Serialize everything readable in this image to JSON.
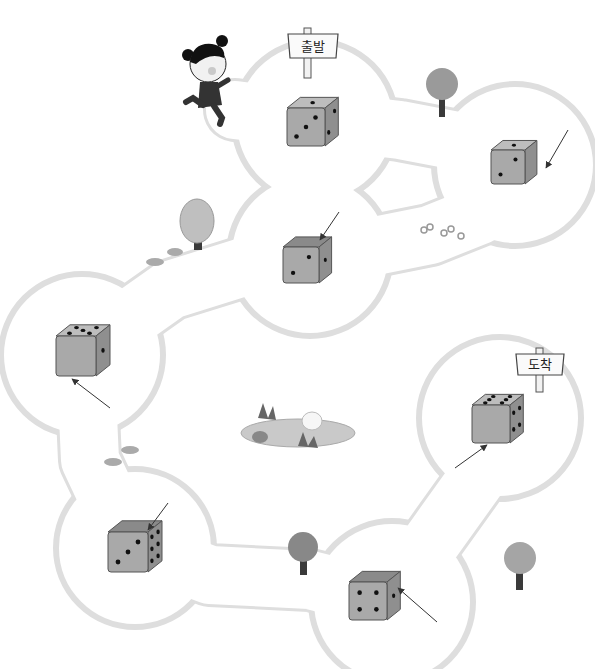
{
  "worksheet": {
    "start_sign": "출발",
    "finish_sign": "도착",
    "colors": {
      "path_outline": "#dedede",
      "die_top": "#bdbdbd",
      "die_front": "#a9a9a9",
      "die_side": "#8f8f8f",
      "die_top_dark": "#8a8a8a",
      "pip": "#111111",
      "tree_canopy": "#9a9a9a",
      "tree_trunk": "#3a3a3a",
      "arrow": "#333333"
    },
    "dice": [
      {
        "id": "die-1",
        "top": 1,
        "front": 3,
        "side": 2,
        "arrow": false
      },
      {
        "id": "die-2",
        "top": 1,
        "front": 2,
        "side": 0,
        "arrow_target": "side"
      },
      {
        "id": "die-3",
        "top": 0,
        "front": 2,
        "side": 1,
        "arrow_target": "top"
      },
      {
        "id": "die-4",
        "top": 5,
        "front": 0,
        "side": 1,
        "arrow_target": "front-bottom"
      },
      {
        "id": "die-5",
        "top": 0,
        "front": 3,
        "side": 6,
        "arrow_target": "top"
      },
      {
        "id": "die-6",
        "top": 0,
        "front": 4,
        "side": 1,
        "arrow_target": "side"
      },
      {
        "id": "die-7",
        "top": 6,
        "front": 0,
        "side": 4,
        "arrow_target": "front-bottom"
      }
    ],
    "decorations": [
      "running-girl",
      "tree",
      "tree",
      "tree",
      "tree",
      "flowers",
      "flowers",
      "flowers",
      "pond-with-duck"
    ]
  }
}
